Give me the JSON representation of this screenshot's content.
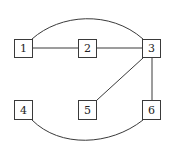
{
  "diagram": {
    "type": "graph",
    "nodes": [
      {
        "id": "1",
        "label": "1",
        "x": 14,
        "y": 39,
        "w": 18,
        "h": 19
      },
      {
        "id": "2",
        "label": "2",
        "x": 78,
        "y": 39,
        "w": 19,
        "h": 19
      },
      {
        "id": "3",
        "label": "3",
        "x": 142,
        "y": 39,
        "w": 19,
        "h": 19
      },
      {
        "id": "4",
        "label": "4",
        "x": 14,
        "y": 100,
        "w": 19,
        "h": 20
      },
      {
        "id": "5",
        "label": "5",
        "x": 78,
        "y": 100,
        "w": 19,
        "h": 20
      },
      {
        "id": "6",
        "label": "6",
        "x": 142,
        "y": 100,
        "w": 19,
        "h": 20
      }
    ],
    "edges": [
      {
        "from": "1",
        "to": "2",
        "style": "straight"
      },
      {
        "from": "2",
        "to": "3",
        "style": "straight"
      },
      {
        "from": "1",
        "to": "3",
        "style": "curved-top"
      },
      {
        "from": "3",
        "to": "5",
        "style": "straight"
      },
      {
        "from": "3",
        "to": "6",
        "style": "straight"
      },
      {
        "from": "4",
        "to": "6",
        "style": "curved-bottom"
      }
    ],
    "colors": {
      "stroke": "#3a3a3a",
      "fill": "#ffffff",
      "text": "#222222"
    }
  }
}
